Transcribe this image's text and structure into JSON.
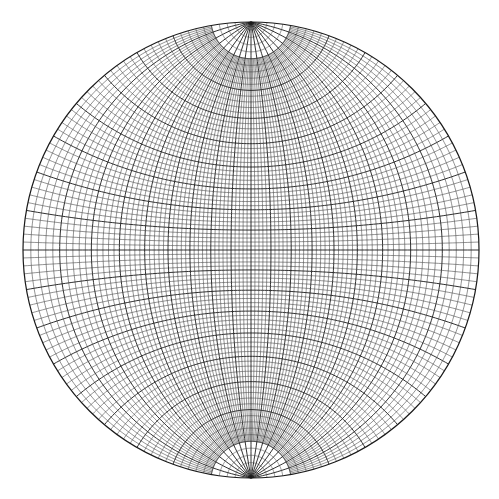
{
  "figure": {
    "kind": "Wulff stereographic net",
    "grid_interval_deg": 2,
    "major_interval_deg": 10,
    "polar_cap_deg": 10,
    "polar_radial_interval_deg": 10,
    "line_color": "#1a1a1a",
    "minor_line_color": "#3a3a3a",
    "background": "#ffffff"
  }
}
